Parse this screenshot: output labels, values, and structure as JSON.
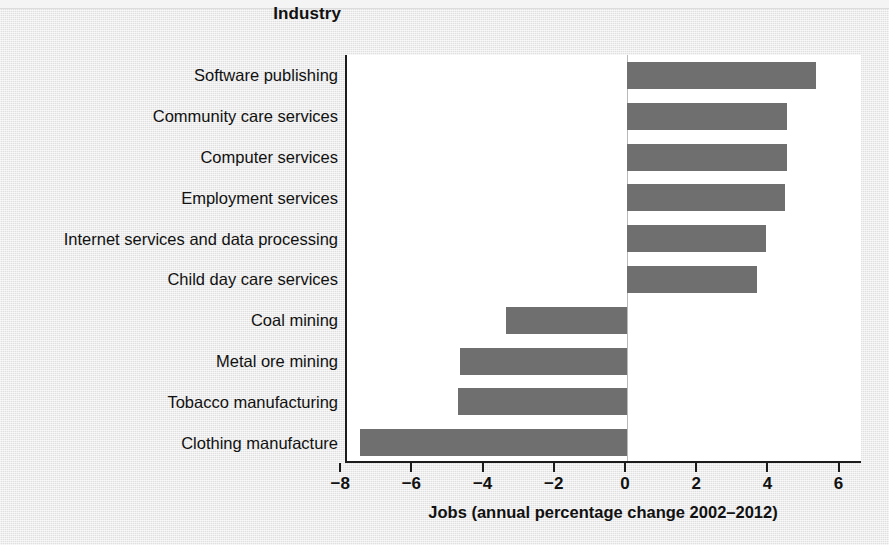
{
  "figure": {
    "category_axis_title": "Industry",
    "x_axis_title": "Jobs (annual percentage change 2002–2012)",
    "bar_color": "#6f6f6f",
    "plot_background": "#ffffff",
    "page_background": "#e9e9e9",
    "axis_color": "#1c1c1c"
  },
  "chart_data": {
    "type": "bar",
    "orientation": "horizontal",
    "title": "",
    "xlabel": "Jobs (annual percentage change 2002–2012)",
    "ylabel": "Industry",
    "xlim": [
      -8.6,
      6.6
    ],
    "xticks": [
      -8,
      -6,
      -4,
      -2,
      0,
      2,
      4,
      6
    ],
    "xtick_labels": [
      "−8",
      "−6",
      "−4",
      "−2",
      "0",
      "2",
      "4",
      "6"
    ],
    "grid": false,
    "legend": false,
    "categories": [
      "Software publishing",
      "Community care services",
      "Computer services",
      "Employment services",
      "Internet services and data processing",
      "Child day care services",
      "Coal mining",
      "Metal ore mining",
      "Tobacco manufacturing",
      "Clothing manufacture"
    ],
    "values": [
      5.3,
      4.5,
      4.5,
      4.45,
      3.9,
      3.65,
      -3.4,
      -4.7,
      -4.75,
      -7.5
    ]
  }
}
